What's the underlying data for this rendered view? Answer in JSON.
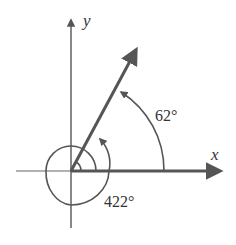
{
  "diagram": {
    "type": "angle-in-standard-position",
    "axes": {
      "x_label": "x",
      "y_label": "y"
    },
    "angles": [
      {
        "label": "62°",
        "degrees": 62,
        "description": "reference angle measured counterclockwise from positive x-axis"
      },
      {
        "label": "422°",
        "degrees": 422,
        "description": "one full rotation plus 62°, counterclockwise"
      }
    ],
    "colors": {
      "stroke": "#555555",
      "text": "#333333",
      "background": "#ffffff"
    }
  }
}
